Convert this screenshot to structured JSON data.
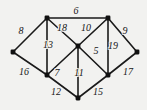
{
  "figure": {
    "background_color": "#f2f2f0",
    "edge_color": "#1a1a1a",
    "vertex_color": "#111111",
    "label_color": "#171717"
  },
  "chart_data": {
    "type": "diagram",
    "title": "",
    "xlabel": "",
    "ylabel": "",
    "layout": "planar weighted graph, 8 vertices, 14 labeled edges",
    "nodes": [
      {
        "id": "v-top-left",
        "x": 47,
        "y": 18
      },
      {
        "id": "v-top-right",
        "x": 108,
        "y": 18
      },
      {
        "id": "v-left",
        "x": 13,
        "y": 52
      },
      {
        "id": "v-center",
        "x": 78,
        "y": 46
      },
      {
        "id": "v-right",
        "x": 137,
        "y": 52
      },
      {
        "id": "v-bottom-left",
        "x": 47,
        "y": 75
      },
      {
        "id": "v-bottom-right",
        "x": 108,
        "y": 75
      },
      {
        "id": "v-bottom-center",
        "x": 78,
        "y": 98
      }
    ],
    "edges": [
      {
        "id": "e-6",
        "from": "v-top-left",
        "to": "v-top-right",
        "weight": "6",
        "lx": 76,
        "ly": 11
      },
      {
        "id": "e-8",
        "from": "v-left",
        "to": "v-top-left",
        "weight": "8",
        "lx": 21,
        "ly": 31
      },
      {
        "id": "e-18",
        "from": "v-top-left",
        "to": "v-center",
        "weight": "18",
        "lx": 62,
        "ly": 28
      },
      {
        "id": "e-10",
        "from": "v-center",
        "to": "v-top-right",
        "weight": "10",
        "lx": 86,
        "ly": 28
      },
      {
        "id": "e-9",
        "from": "v-top-right",
        "to": "v-right",
        "weight": "9",
        "lx": 125,
        "ly": 31
      },
      {
        "id": "e-13",
        "from": "v-top-left",
        "to": "v-bottom-left",
        "weight": "13",
        "lx": 48,
        "ly": 45
      },
      {
        "id": "e-5",
        "from": "v-center",
        "to": "v-bottom-right",
        "weight": "5",
        "lx": 96,
        "ly": 51
      },
      {
        "id": "e-19",
        "from": "v-top-right",
        "to": "v-bottom-right",
        "weight": "19",
        "lx": 113,
        "ly": 46
      },
      {
        "id": "e-16",
        "from": "v-left",
        "to": "v-bottom-left",
        "weight": "16",
        "lx": 24,
        "ly": 72
      },
      {
        "id": "e-7",
        "from": "v-bottom-left",
        "to": "v-center",
        "weight": "7",
        "lx": 57,
        "ly": 73
      },
      {
        "id": "e-11",
        "from": "v-center",
        "to": "v-bottom-center",
        "weight": "11",
        "lx": 79,
        "ly": 73
      },
      {
        "id": "e-17",
        "from": "v-bottom-right",
        "to": "v-right",
        "weight": "17",
        "lx": 128,
        "ly": 72
      },
      {
        "id": "e-12",
        "from": "v-bottom-left",
        "to": "v-bottom-center",
        "weight": "12",
        "lx": 56,
        "ly": 92
      },
      {
        "id": "e-15",
        "from": "v-bottom-center",
        "to": "v-bottom-right",
        "weight": "15",
        "lx": 98,
        "ly": 92
      }
    ]
  }
}
